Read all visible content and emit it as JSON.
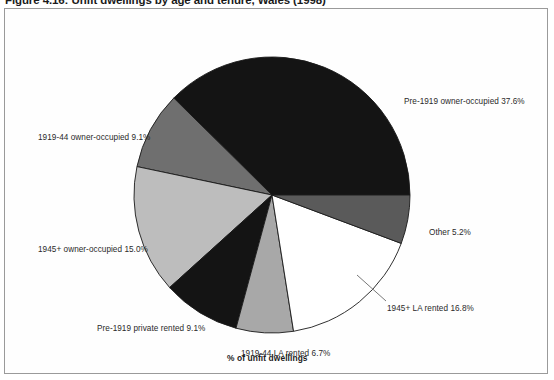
{
  "figure": {
    "title": "Figure 4.16: Unfit dwellings by age and tenure, Wales (1998)",
    "caption": "% of unfit dwellings"
  },
  "chart_data": {
    "type": "pie",
    "title": "Figure 4.16: Unfit dwellings by age and tenure, Wales (1998)",
    "xlabel": "% of unfit dwellings",
    "ylabel": "",
    "legend_position": "callout-labels",
    "units": "percent",
    "start_angle_deg": 0,
    "direction": "counter-clockwise",
    "categories": [
      "Pre-1919 owner-occupied",
      "1919-44 owner-occupied",
      "1945+ owner-occupied",
      "Pre-1919 private rented",
      "1919-44 LA rented",
      "1945+ LA rented",
      "Other"
    ],
    "values": [
      37.6,
      9.1,
      15.0,
      9.1,
      6.7,
      16.8,
      5.2
    ],
    "slices": [
      {
        "label": "Pre-1919 owner-occupied 37.6%",
        "name": "Pre-1919 owner-occupied",
        "value": 37.6,
        "color": "#141414",
        "start_deg": 0,
        "end_deg": 135.36,
        "label_x": 399,
        "label_y": 88
      },
      {
        "label": "1919-44 owner-occupied 9.1%",
        "name": "1919-44 owner-occupied",
        "value": 9.1,
        "color": "#6f6f6f",
        "start_deg": 135.36,
        "end_deg": 168.12,
        "label_x": 33,
        "label_y": 124
      },
      {
        "label": "1945+ owner-occupied 15.0%",
        "name": "1945+ owner-occupied",
        "value": 15.0,
        "color": "#bdbdbd",
        "start_deg": 168.12,
        "end_deg": 222.12,
        "label_x": 33,
        "label_y": 236
      },
      {
        "label": "Pre-1919 private rented 9.1%",
        "name": "Pre-1919 private rented",
        "value": 9.1,
        "color": "#141414",
        "start_deg": 222.12,
        "end_deg": 254.88,
        "label_x": 92,
        "label_y": 315
      },
      {
        "label": "1919-44 LA rented 6.7%",
        "name": "1919-44 LA rented",
        "value": 6.7,
        "color": "#a8a8a8",
        "start_deg": 254.88,
        "end_deg": 278.99,
        "label_x": 236,
        "label_y": 340
      },
      {
        "label": "1945+ LA rented 16.8%",
        "name": "1945+ LA rented",
        "value": 16.8,
        "color": "#ffffff",
        "start_deg": 278.99,
        "end_deg": 339.47,
        "label_x": 382,
        "label_y": 295
      },
      {
        "label": "Other 5.2%",
        "name": "Other",
        "value": 5.2,
        "color": "#5a5a5a",
        "start_deg": 339.47,
        "end_deg": 360,
        "label_x": 424,
        "label_y": 219
      }
    ]
  },
  "style": {
    "frame_border": "#9a9a9a",
    "slice_outline": "#1a1a1a",
    "background": "#ffffff",
    "text_color": "#2a2a2a"
  }
}
